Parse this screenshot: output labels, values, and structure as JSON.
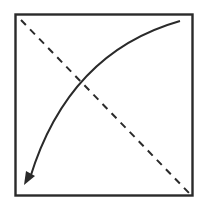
{
  "diagram": {
    "colors": {
      "background": "#ffffff",
      "stroke": "#2a2a2a"
    },
    "elements": [
      {
        "type": "square",
        "name": "outer-square",
        "x": 15,
        "y": 14,
        "width": 177,
        "height": 181
      },
      {
        "type": "dashed-line",
        "name": "diagonal-dashed-line",
        "from": [
          21,
          20
        ],
        "to": [
          190,
          194
        ]
      },
      {
        "type": "curved-arrow",
        "name": "curved-arrow",
        "from": [
          180,
          21
        ],
        "to": [
          28,
          183
        ],
        "direction": "top-right to bottom-left"
      }
    ]
  }
}
